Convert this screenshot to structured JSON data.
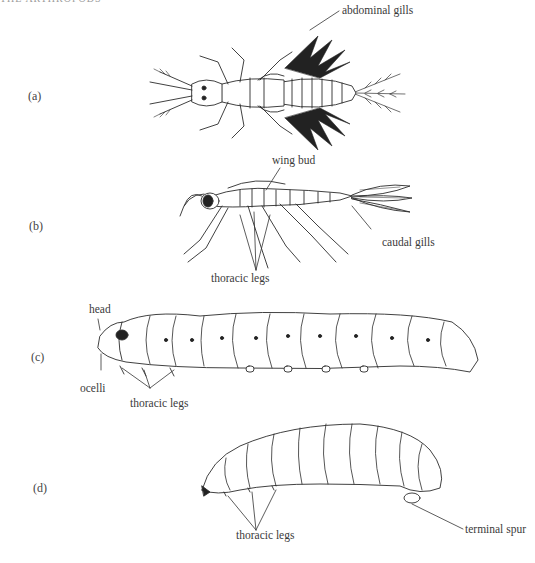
{
  "figure": {
    "header_fragment": "THE ARTHROPODS",
    "panels": [
      {
        "id": "a",
        "label": "(a)",
        "callouts": [
          "abdominal gills"
        ]
      },
      {
        "id": "b",
        "label": "(b)",
        "callouts": [
          "wing bud",
          "caudal gills",
          "thoracic legs"
        ]
      },
      {
        "id": "c",
        "label": "(c)",
        "callouts": [
          "head",
          "ocelli",
          "thoracic legs"
        ]
      },
      {
        "id": "d",
        "label": "(d)",
        "callouts": [
          "thoracic legs",
          "terminal spur"
        ]
      }
    ]
  }
}
